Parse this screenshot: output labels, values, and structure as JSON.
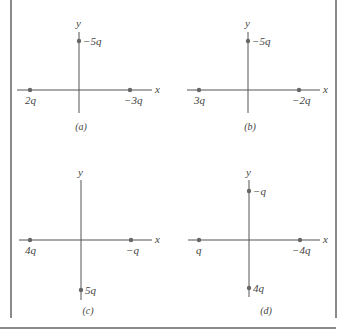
{
  "figure": {
    "panels": [
      {
        "caption": "(a)",
        "axis_x_label": "x",
        "axis_y_label": "y",
        "charges": [
          {
            "position": "left-x",
            "label": "2q"
          },
          {
            "position": "right-x",
            "label": "−3q"
          },
          {
            "position": "top-y",
            "label": "−5q"
          }
        ]
      },
      {
        "caption": "(b)",
        "axis_x_label": "x",
        "axis_y_label": "y",
        "charges": [
          {
            "position": "left-x",
            "label": "3q"
          },
          {
            "position": "right-x",
            "label": "−2q"
          },
          {
            "position": "top-y",
            "label": "−5q"
          }
        ]
      },
      {
        "caption": "(c)",
        "axis_x_label": "x",
        "axis_y_label": "y",
        "charges": [
          {
            "position": "left-x",
            "label": "4q"
          },
          {
            "position": "right-x",
            "label": "−q"
          },
          {
            "position": "bottom-y",
            "label": "5q"
          }
        ]
      },
      {
        "caption": "(d)",
        "axis_x_label": "x",
        "axis_y_label": "y",
        "charges": [
          {
            "position": "left-x",
            "label": "q"
          },
          {
            "position": "right-x",
            "label": "−4q"
          },
          {
            "position": "top-y",
            "label": "−q"
          },
          {
            "position": "bottom-y",
            "label": "4q"
          }
        ]
      }
    ]
  }
}
